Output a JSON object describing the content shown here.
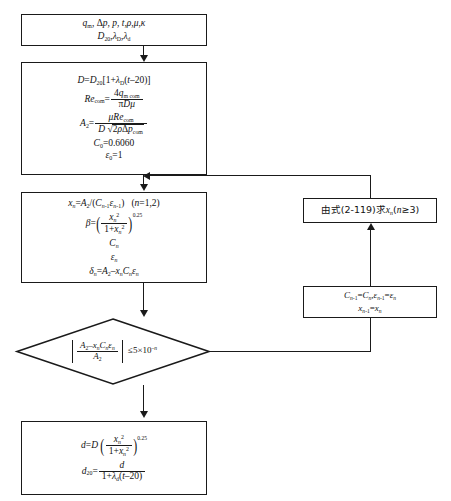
{
  "diagram": {
    "type": "flowchart",
    "language": "zh-CN + math",
    "nodes": [
      {
        "id": "start-inputs",
        "shape": "rectangle",
        "lines": [
          "q_m, Δp, p, t, ρ, μ, κ",
          "D_20, λ_D, λ_d"
        ]
      },
      {
        "id": "init-compute",
        "shape": "rectangle",
        "lines": [
          "D = D_20[1 + λ_D(t−20)]",
          "Re_com = 4q_(m com) / (πDμ)",
          "A_2 = μRe_com / (D √(2ρΔp_com))",
          "C_0 = 0.6060",
          "ε_0 = 1"
        ],
        "values": {
          "C0": "0.6060",
          "eps0": "1"
        }
      },
      {
        "id": "iterate-n12",
        "shape": "rectangle",
        "lines": [
          "x_n = A_2/(C_(n−1) ε_(n−1))   (n = 1,2)",
          "β = ( x_n^2 / (1 + x_n^2) )^0.25",
          "C_n",
          "ε_n",
          "δ_n = A_2 − x_n C_n ε_n"
        ],
        "values": {
          "n_range": "(n=1,2)",
          "exponent": "0.25"
        }
      },
      {
        "id": "convergence-test",
        "shape": "diamond",
        "lines": [
          "| (A_2 − x_n C_n ε_n) / A_2 |  ≤ 5 × 10^(−n)"
        ],
        "values": {
          "tolerance": "5×10^-n"
        }
      },
      {
        "id": "result-diameter",
        "shape": "rectangle",
        "lines": [
          "d = D ( x_n^2 / (1 + x_n^2) )^0.25",
          "d_20 = d / (1 + λ_d(t−20))"
        ]
      },
      {
        "id": "solve-eq-2-119",
        "shape": "rectangle",
        "lines": [
          "由式(2-119)求x_n(n≥3)"
        ],
        "text_plain": "由式(2-119)求xn(n≥3)",
        "equation_ref": "(2-119)",
        "condition": "n≥3"
      },
      {
        "id": "update-vars",
        "shape": "rectangle",
        "lines": [
          "C_(n−1) = C_n, ε_(n−1) = ε_n",
          "x_(n−1) = x_n"
        ]
      }
    ],
    "edges": [
      {
        "from": "start-inputs",
        "to": "init-compute",
        "direction": "down"
      },
      {
        "from": "init-compute",
        "to": "iterate-n12",
        "direction": "down"
      },
      {
        "from": "iterate-n12",
        "to": "convergence-test",
        "direction": "down"
      },
      {
        "from": "convergence-test",
        "to": "result-diameter",
        "direction": "down",
        "label": ""
      },
      {
        "from": "convergence-test",
        "to": "update-vars",
        "direction": "right-then-up",
        "label": ""
      },
      {
        "from": "update-vars",
        "to": "solve-eq-2-119",
        "direction": "up"
      },
      {
        "from": "solve-eq-2-119",
        "to": "init-compute",
        "direction": "up-then-left"
      }
    ],
    "symbols": {
      "q_m": "q",
      "delta_p": "Δp",
      "p": "p",
      "t": "t",
      "rho": "ρ",
      "mu": "μ",
      "kappa": "κ",
      "D20": "D",
      "lambda_D": "λ",
      "lambda_d": "λ",
      "beta": "β",
      "epsilon": "ε",
      "delta": "δ",
      "Re": "Re",
      "A2": "A",
      "sub_com": "com",
      "sub_m_com": "m com",
      "minus20": "−20",
      "eq_ref": "(2-119)",
      "cjk_from_formula": "由式",
      "cjk_solve": "求",
      "ge": "≥",
      "le": "≤",
      "times": "×",
      "sqrt": "√"
    },
    "colors": {
      "stroke": "#1a1a1a",
      "fill": "#ffffff",
      "text": "#111111"
    }
  }
}
